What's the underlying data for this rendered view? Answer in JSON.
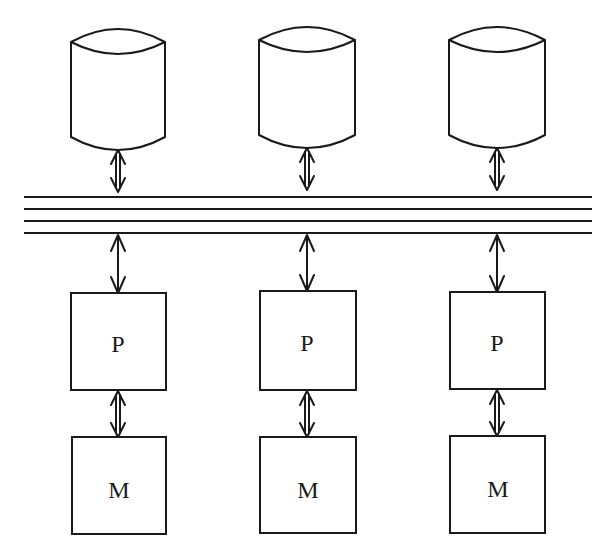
{
  "diagram": {
    "bus": {
      "lines": 4,
      "x_start": 24,
      "x_end": 592,
      "y_positions": [
        197,
        209,
        221,
        233
      ]
    },
    "columns": [
      {
        "id": "col-1",
        "center_x": 118,
        "disk": {
          "label": ""
        },
        "processor": {
          "label": "P"
        },
        "memory": {
          "label": "M"
        }
      },
      {
        "id": "col-2",
        "center_x": 307,
        "disk": {
          "label": ""
        },
        "processor": {
          "label": "P"
        },
        "memory": {
          "label": "M"
        }
      },
      {
        "id": "col-3",
        "center_x": 497,
        "disk": {
          "label": ""
        },
        "processor": {
          "label": "P"
        },
        "memory": {
          "label": "M"
        }
      }
    ],
    "colors": {
      "stroke": "#1a1a1a",
      "background": "#ffffff"
    }
  }
}
